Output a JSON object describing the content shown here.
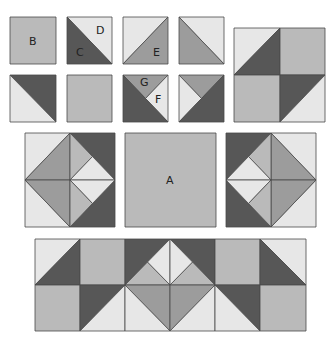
{
  "colors": {
    "dark": "#575757",
    "medium": "#9c9c9c",
    "mediumlight": "#bababa",
    "light": "#e7e7e7"
  },
  "labels": [
    {
      "text": "B",
      "x": 29,
      "y": 45
    },
    {
      "text": "D",
      "x": 96,
      "y": 34
    },
    {
      "text": "C",
      "x": 76,
      "y": 56
    },
    {
      "text": "E",
      "x": 153,
      "y": 56
    },
    {
      "text": "G",
      "x": 140,
      "y": 86
    },
    {
      "text": "F",
      "x": 155,
      "y": 103
    },
    {
      "text": "A",
      "x": 166,
      "y": 184
    }
  ],
  "shapes": [
    {
      "name": "patch-b",
      "c": "mediumlight",
      "pts": "10,17 56,17 56,64 10,64"
    },
    {
      "name": "patch-d",
      "c": "light",
      "pts": "67,17 112,17 112,64"
    },
    {
      "name": "patch-c",
      "c": "dark",
      "pts": "67,17 112,64 67,64"
    },
    {
      "name": "patch-e-light",
      "c": "light",
      "pts": "123,17 168,17 123,64"
    },
    {
      "name": "patch-e",
      "c": "medium",
      "pts": "168,17 168,64 123,64"
    },
    {
      "name": "patch-4-light",
      "c": "light",
      "pts": "179,17 224,17 224,64"
    },
    {
      "name": "patch-4-medium",
      "c": "medium",
      "pts": "179,17 224,64 179,64"
    },
    {
      "name": "patch-5-dark",
      "c": "dark",
      "pts": "10,75 56,75 56,122"
    },
    {
      "name": "patch-5-light",
      "c": "light",
      "pts": "10,75 56,122 10,122"
    },
    {
      "name": "patch-6",
      "c": "mediumlight",
      "pts": "67,75 112,75 112,122 67,122"
    },
    {
      "name": "patch-g",
      "c": "medium",
      "pts": "123,75 168,75 145.5,98.5"
    },
    {
      "name": "patch-f",
      "c": "light",
      "pts": "168,75 168,122 145.5,98.5"
    },
    {
      "name": "patch-7-dark",
      "c": "dark",
      "pts": "123,75 145.5,98.5 168,122 123,122"
    },
    {
      "name": "patch-8-top",
      "c": "medium",
      "pts": "179,75 224,75 201.5,98.5"
    },
    {
      "name": "patch-8-left",
      "c": "light",
      "pts": "179,75 201.5,98.5 179,122"
    },
    {
      "name": "patch-8-dark",
      "c": "dark",
      "pts": "224,75 224,122 179,122 201.5,98.5"
    },
    {
      "name": "block-tr-q1-light",
      "c": "light",
      "pts": "234,28 280,28 234,75"
    },
    {
      "name": "block-tr-q1-dark",
      "c": "dark",
      "pts": "280,28 280,75 234,75"
    },
    {
      "name": "block-tr-q2",
      "c": "mediumlight",
      "pts": "280,28 325,28 325,75 280,75"
    },
    {
      "name": "block-tr-q3",
      "c": "mediumlight",
      "pts": "234,75 280,75 280,122 234,122"
    },
    {
      "name": "block-tr-q4-dark",
      "c": "dark",
      "pts": "280,75 325,75 280,122"
    },
    {
      "name": "block-tr-q4-light",
      "c": "light",
      "pts": "325,75 325,122 280,122"
    },
    {
      "name": "lblock-tl",
      "c": "light",
      "pts": "25,133 70,133 25,180"
    },
    {
      "name": "lblock-bl",
      "c": "light",
      "pts": "25,180 70,227 25,227"
    },
    {
      "name": "lblock-tr",
      "c": "dark",
      "pts": "70,133 115,133 115,180"
    },
    {
      "name": "lblock-br",
      "c": "dark",
      "pts": "115,180 115,227 70,227"
    },
    {
      "name": "lblock-dl1",
      "c": "medium",
      "pts": "70,133 25,180 70,180"
    },
    {
      "name": "lblock-dl2",
      "c": "medium",
      "pts": "25,180 70,227 70,180"
    },
    {
      "name": "lblock-ur-out",
      "c": "mediumlight",
      "pts": "70,133 92.5,156.5 70,180"
    },
    {
      "name": "lblock-ur-in",
      "c": "light",
      "pts": "92.5,156.5 115,180 70,180"
    },
    {
      "name": "lblock-lr-in",
      "c": "light",
      "pts": "70,180 115,180 92.5,203.5"
    },
    {
      "name": "lblock-lr-out",
      "c": "mediumlight",
      "pts": "70,180 92.5,203.5 70,227"
    },
    {
      "name": "square-a",
      "c": "mediumlight",
      "pts": "125,133 216,133 216,227 125,227"
    },
    {
      "name": "rblock-tr",
      "c": "light",
      "pts": "271,133 316,133 316,180"
    },
    {
      "name": "rblock-br",
      "c": "light",
      "pts": "316,180 316,227 271,227"
    },
    {
      "name": "rblock-tl",
      "c": "dark",
      "pts": "226,133 271,133 226,180"
    },
    {
      "name": "rblock-bl",
      "c": "dark",
      "pts": "226,180 271,227 226,227"
    },
    {
      "name": "rblock-dr1",
      "c": "medium",
      "pts": "271,133 316,180 271,180"
    },
    {
      "name": "rblock-dr2",
      "c": "medium",
      "pts": "316,180 271,227 271,180"
    },
    {
      "name": "rblock-ul-out",
      "c": "mediumlight",
      "pts": "271,133 248.5,156.5 271,180"
    },
    {
      "name": "rblock-ul-in",
      "c": "light",
      "pts": "248.5,156.5 226,180 271,180"
    },
    {
      "name": "rblock-ll-in",
      "c": "light",
      "pts": "271,180 226,180 248.5,203.5"
    },
    {
      "name": "rblock-ll-out",
      "c": "mediumlight",
      "pts": "271,180 248.5,203.5 271,227"
    },
    {
      "name": "strip-r1c0-light",
      "c": "light",
      "pts": "35,239 80,239 35,285"
    },
    {
      "name": "strip-r1c0-dark",
      "c": "dark",
      "pts": "80,239 80,285 35,285"
    },
    {
      "name": "strip-r1c1",
      "c": "mediumlight",
      "pts": "80,239 125,239 125,285 80,285"
    },
    {
      "name": "strip-r1c2-dark",
      "c": "dark",
      "pts": "125,239 170,239 125,285"
    },
    {
      "name": "strip-r1c2-ml",
      "c": "mediumlight",
      "pts": "125,285 147.5,262 170,285"
    },
    {
      "name": "strip-r1c2-light",
      "c": "light",
      "pts": "147.5,262 170,239 170,285"
    },
    {
      "name": "strip-r1c3-dark",
      "c": "dark",
      "pts": "170,239 215,239 215,285"
    },
    {
      "name": "strip-r1c3-ml",
      "c": "mediumlight",
      "pts": "170,285 192.5,262 215,285"
    },
    {
      "name": "strip-r1c3-light",
      "c": "light",
      "pts": "170,239 192.5,262 170,285"
    },
    {
      "name": "strip-r1c4",
      "c": "mediumlight",
      "pts": "215,239 260,239 260,285 215,285"
    },
    {
      "name": "strip-r1c5-light",
      "c": "light",
      "pts": "260,239 306,239 306,285"
    },
    {
      "name": "strip-r1c5-dark",
      "c": "dark",
      "pts": "260,239 306,285 260,285"
    },
    {
      "name": "strip-r2c0",
      "c": "mediumlight",
      "pts": "35,285 80,285 80,331 35,331"
    },
    {
      "name": "strip-r2c1-dark",
      "c": "dark",
      "pts": "80,285 125,285 80,331"
    },
    {
      "name": "strip-r2c1-light",
      "c": "light",
      "pts": "125,285 125,331 80,331"
    },
    {
      "name": "strip-r2c2-med",
      "c": "medium",
      "pts": "125,285 170,285 170,331"
    },
    {
      "name": "strip-r2c2-light",
      "c": "light",
      "pts": "125,285 170,331 125,331"
    },
    {
      "name": "strip-r2c3-med",
      "c": "medium",
      "pts": "170,285 215,285 170,331"
    },
    {
      "name": "strip-r2c3-light",
      "c": "light",
      "pts": "215,285 215,331 170,331"
    },
    {
      "name": "strip-r2c4-dark",
      "c": "dark",
      "pts": "215,285 260,285 260,331"
    },
    {
      "name": "strip-r2c4-light",
      "c": "light",
      "pts": "215,285 260,331 215,331"
    },
    {
      "name": "strip-r2c5",
      "c": "mediumlight",
      "pts": "260,285 306,285 306,331 260,331"
    }
  ]
}
